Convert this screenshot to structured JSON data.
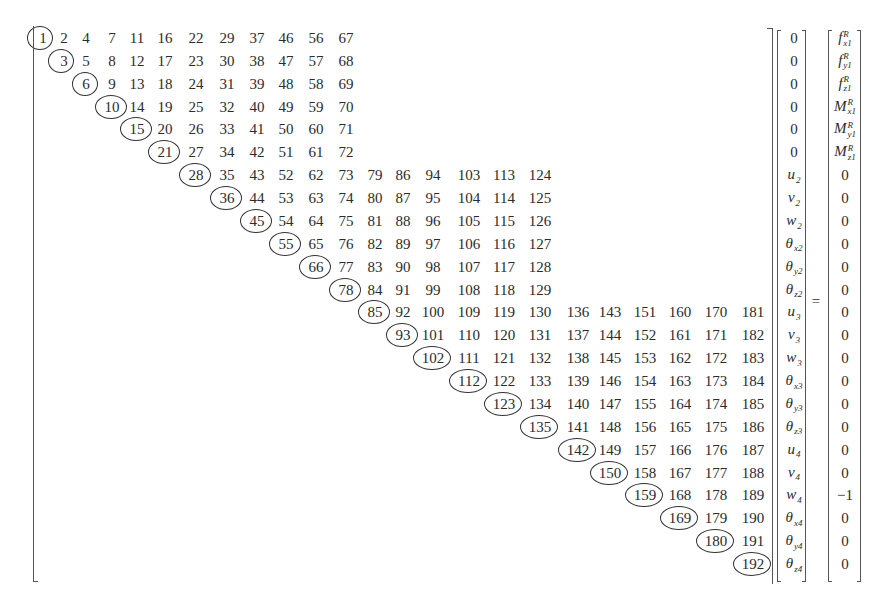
{
  "equation": {
    "description": "Symmetric skyline stiffness matrix storage indices times displacement vector equals force vector",
    "equals_sign": "=",
    "matrix": {
      "diagonal_circled": [
        1,
        3,
        6,
        10,
        15,
        21,
        28,
        36,
        45,
        55,
        66,
        78,
        85,
        93,
        102,
        112,
        123,
        135,
        142,
        150,
        159,
        169,
        180,
        192
      ],
      "rows": [
        [
          1,
          2,
          4,
          7,
          11,
          16,
          22,
          29,
          37,
          46,
          56,
          67
        ],
        [
          3,
          5,
          8,
          12,
          17,
          23,
          30,
          38,
          47,
          57,
          68
        ],
        [
          6,
          9,
          13,
          18,
          24,
          31,
          39,
          48,
          58,
          69
        ],
        [
          10,
          14,
          19,
          25,
          32,
          40,
          49,
          59,
          70
        ],
        [
          15,
          20,
          26,
          33,
          41,
          50,
          60,
          71
        ],
        [
          21,
          27,
          34,
          42,
          51,
          61,
          72
        ],
        [
          28,
          35,
          43,
          52,
          62,
          73,
          79,
          86,
          94,
          103,
          113,
          124
        ],
        [
          36,
          44,
          53,
          63,
          74,
          80,
          87,
          95,
          104,
          114,
          125
        ],
        [
          45,
          54,
          64,
          75,
          81,
          88,
          96,
          105,
          115,
          126
        ],
        [
          55,
          65,
          76,
          82,
          89,
          97,
          106,
          116,
          127
        ],
        [
          66,
          77,
          83,
          90,
          98,
          107,
          117,
          128
        ],
        [
          78,
          84,
          91,
          99,
          108,
          118,
          129
        ],
        [
          85,
          92,
          100,
          109,
          119,
          130,
          136,
          143,
          151,
          160,
          170,
          181
        ],
        [
          93,
          101,
          110,
          120,
          131,
          137,
          144,
          152,
          161,
          171,
          182
        ],
        [
          102,
          111,
          121,
          132,
          138,
          145,
          153,
          162,
          172,
          183
        ],
        [
          112,
          122,
          133,
          139,
          146,
          154,
          163,
          173,
          184
        ],
        [
          123,
          134,
          140,
          147,
          155,
          164,
          174,
          185
        ],
        [
          135,
          141,
          148,
          156,
          165,
          175,
          186
        ],
        [
          142,
          149,
          157,
          166,
          176,
          187
        ],
        [
          150,
          158,
          167,
          177,
          188
        ],
        [
          159,
          168,
          178,
          189
        ],
        [
          169,
          179,
          190
        ],
        [
          180,
          191
        ],
        [
          192
        ]
      ]
    },
    "displacement_vector": [
      {
        "base": "0",
        "sub": "",
        "sup": "",
        "numeric": true
      },
      {
        "base": "0",
        "sub": "",
        "sup": "",
        "numeric": true
      },
      {
        "base": "0",
        "sub": "",
        "sup": "",
        "numeric": true
      },
      {
        "base": "0",
        "sub": "",
        "sup": "",
        "numeric": true
      },
      {
        "base": "0",
        "sub": "",
        "sup": "",
        "numeric": true
      },
      {
        "base": "0",
        "sub": "",
        "sup": "",
        "numeric": true
      },
      {
        "base": "u",
        "sub": "2",
        "sup": "",
        "numeric": false
      },
      {
        "base": "v",
        "sub": "2",
        "sup": "",
        "numeric": false
      },
      {
        "base": "w",
        "sub": "2",
        "sup": "",
        "numeric": false
      },
      {
        "base": "θ",
        "sub": "x2",
        "sup": "",
        "numeric": false
      },
      {
        "base": "θ",
        "sub": "y2",
        "sup": "",
        "numeric": false
      },
      {
        "base": "θ",
        "sub": "z2",
        "sup": "",
        "numeric": false
      },
      {
        "base": "u",
        "sub": "3",
        "sup": "",
        "numeric": false
      },
      {
        "base": "v",
        "sub": "3",
        "sup": "",
        "numeric": false
      },
      {
        "base": "w",
        "sub": "3",
        "sup": "",
        "numeric": false
      },
      {
        "base": "θ",
        "sub": "x3",
        "sup": "",
        "numeric": false
      },
      {
        "base": "θ",
        "sub": "y3",
        "sup": "",
        "numeric": false
      },
      {
        "base": "θ",
        "sub": "z3",
        "sup": "",
        "numeric": false
      },
      {
        "base": "u",
        "sub": "4",
        "sup": "",
        "numeric": false
      },
      {
        "base": "v",
        "sub": "4",
        "sup": "",
        "numeric": false
      },
      {
        "base": "w",
        "sub": "4",
        "sup": "",
        "numeric": false
      },
      {
        "base": "θ",
        "sub": "x4",
        "sup": "",
        "numeric": false
      },
      {
        "base": "θ",
        "sub": "y4",
        "sup": "",
        "numeric": false
      },
      {
        "base": "θ",
        "sub": "z4",
        "sup": "",
        "numeric": false
      }
    ],
    "force_vector": [
      {
        "base": "f",
        "sub": "x1",
        "sup": "R",
        "numeric": false
      },
      {
        "base": "f",
        "sub": "y1",
        "sup": "R",
        "numeric": false
      },
      {
        "base": "f",
        "sub": "z1",
        "sup": "R",
        "numeric": false
      },
      {
        "base": "M",
        "sub": "x1",
        "sup": "R",
        "numeric": false
      },
      {
        "base": "M",
        "sub": "y1",
        "sup": "R",
        "numeric": false
      },
      {
        "base": "M",
        "sub": "z1",
        "sup": "R",
        "numeric": false
      },
      {
        "base": "0",
        "sub": "",
        "sup": "",
        "numeric": true
      },
      {
        "base": "0",
        "sub": "",
        "sup": "",
        "numeric": true
      },
      {
        "base": "0",
        "sub": "",
        "sup": "",
        "numeric": true
      },
      {
        "base": "0",
        "sub": "",
        "sup": "",
        "numeric": true
      },
      {
        "base": "0",
        "sub": "",
        "sup": "",
        "numeric": true
      },
      {
        "base": "0",
        "sub": "",
        "sup": "",
        "numeric": true
      },
      {
        "base": "0",
        "sub": "",
        "sup": "",
        "numeric": true
      },
      {
        "base": "0",
        "sub": "",
        "sup": "",
        "numeric": true
      },
      {
        "base": "0",
        "sub": "",
        "sup": "",
        "numeric": true
      },
      {
        "base": "0",
        "sub": "",
        "sup": "",
        "numeric": true
      },
      {
        "base": "0",
        "sub": "",
        "sup": "",
        "numeric": true
      },
      {
        "base": "0",
        "sub": "",
        "sup": "",
        "numeric": true
      },
      {
        "base": "0",
        "sub": "",
        "sup": "",
        "numeric": true
      },
      {
        "base": "0",
        "sub": "",
        "sup": "",
        "numeric": true
      },
      {
        "base": "−1",
        "sub": "",
        "sup": "",
        "numeric": true
      },
      {
        "base": "0",
        "sub": "",
        "sup": "",
        "numeric": true
      },
      {
        "base": "0",
        "sub": "",
        "sup": "",
        "numeric": true
      },
      {
        "base": "0",
        "sub": "",
        "sup": "",
        "numeric": true
      }
    ]
  }
}
